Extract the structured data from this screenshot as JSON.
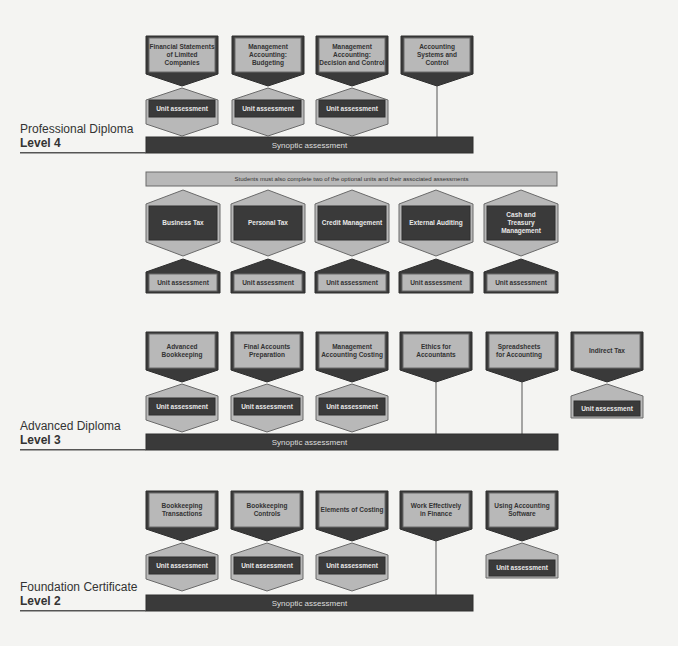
{
  "colors": {
    "dark": "#3a3a3a",
    "light": "#b8b8b8",
    "background": "#f4f4f2",
    "border": "#2e2e2e"
  },
  "levels": {
    "level4": {
      "title": "Professional Diploma",
      "level": "Level 4",
      "mandatory_units": [
        {
          "name": "Financial Statements of Limited Companies",
          "assessment": "Unit assessment"
        },
        {
          "name": "Management Accounting: Budgeting",
          "assessment": "Unit assessment"
        },
        {
          "name": "Management Accounting: Decision and Control",
          "assessment": "Unit assessment"
        },
        {
          "name": "Accounting Systems and Control",
          "assessment": null
        }
      ],
      "synoptic": "Synoptic assessment",
      "optional_note": "Students must also complete two of the optional units and their associated assessments",
      "optional_units": [
        {
          "name": "Business Tax",
          "assessment": "Unit assessment"
        },
        {
          "name": "Personal Tax",
          "assessment": "Unit assessment"
        },
        {
          "name": "Credit Management",
          "assessment": "Unit assessment"
        },
        {
          "name": "External Auditing",
          "assessment": "Unit assessment"
        },
        {
          "name": "Cash and Treasury Management",
          "assessment": "Unit assessment"
        }
      ]
    },
    "level3": {
      "title": "Advanced Diploma",
      "level": "Level 3",
      "units": [
        {
          "name": "Advanced Bookkeeping",
          "assessment": "Unit assessment"
        },
        {
          "name": "Final Accounts Preparation",
          "assessment": "Unit assessment"
        },
        {
          "name": "Management Accounting Costing",
          "assessment": "Unit assessment"
        },
        {
          "name": "Ethics for Accountants",
          "assessment": null
        },
        {
          "name": "Spreadsheets for Accounting",
          "assessment": null
        },
        {
          "name": "Indirect Tax",
          "assessment": "Unit assessment"
        }
      ],
      "synoptic": "Synoptic assessment"
    },
    "level2": {
      "title": "Foundation Certificate",
      "level": "Level 2",
      "units": [
        {
          "name": "Bookkeeping Transactions",
          "assessment": "Unit assessment"
        },
        {
          "name": "Bookkeeping Controls",
          "assessment": "Unit assessment"
        },
        {
          "name": "Elements of Costing",
          "assessment": "Unit assessment"
        },
        {
          "name": "Work Effectively in Finance",
          "assessment": null
        },
        {
          "name": "Using Accounting Software",
          "assessment": "Unit assessment"
        }
      ],
      "synoptic": "Synoptic assessment"
    }
  }
}
